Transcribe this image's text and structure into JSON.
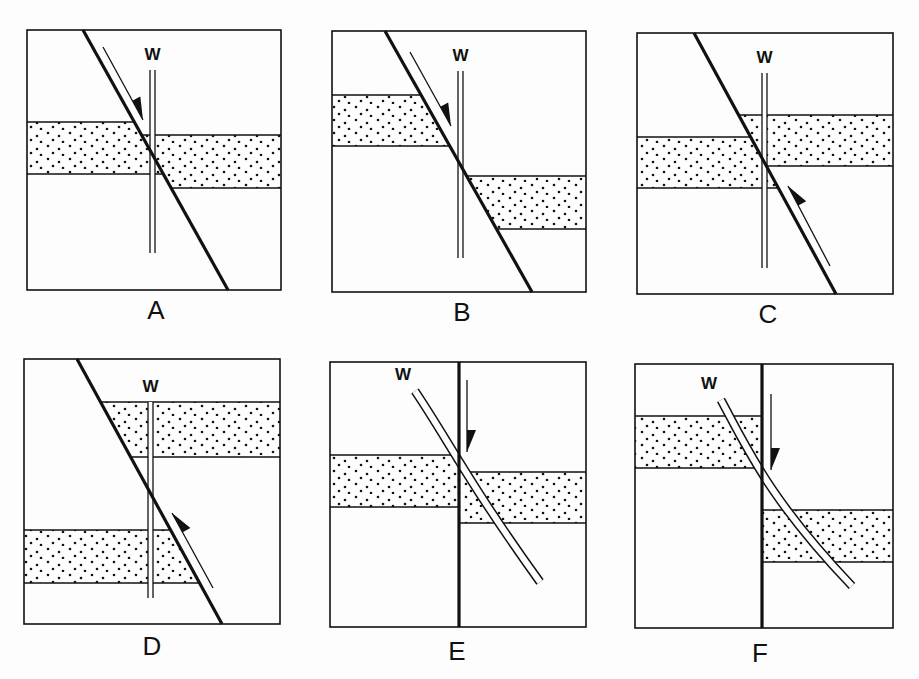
{
  "figure": {
    "colors": {
      "ink": "#111111",
      "paper": "#fdfdfd"
    },
    "well_label": "W",
    "panels": [
      {
        "id": "A",
        "label": "A",
        "box": [
          27,
          30,
          281,
          290
        ],
        "fault": {
          "type": "inclined",
          "from": [
            83,
            30
          ],
          "to": [
            228,
            290
          ]
        },
        "arrow": {
          "from": [
            103,
            47
          ],
          "to": [
            143,
            120
          ],
          "direction": "down"
        },
        "well": {
          "type": "straight",
          "x": 150,
          "gap": 5,
          "top": 70,
          "bottom": 253
        },
        "beds": [
          {
            "side": "left",
            "top": 122,
            "bottom": 174
          },
          {
            "side": "right",
            "top": 135,
            "bottom": 188
          }
        ],
        "label_pos": [
          156,
          297
        ]
      },
      {
        "id": "B",
        "label": "B",
        "box": [
          332,
          31,
          586,
          292
        ],
        "fault": {
          "type": "inclined",
          "from": [
            385,
            31
          ],
          "to": [
            532,
            292
          ]
        },
        "arrow": {
          "from": [
            410,
            52
          ],
          "to": [
            451,
            126
          ],
          "direction": "down"
        },
        "well": {
          "type": "straight",
          "x": 458,
          "gap": 5,
          "top": 71,
          "bottom": 258
        },
        "beds": [
          {
            "side": "left",
            "top": 95,
            "bottom": 146
          },
          {
            "side": "right",
            "top": 176,
            "bottom": 229
          }
        ],
        "label_pos": [
          462,
          299
        ]
      },
      {
        "id": "C",
        "label": "C",
        "box": [
          637,
          33,
          893,
          294
        ],
        "fault": {
          "type": "inclined",
          "from": [
            694,
            33
          ],
          "to": [
            836,
            294
          ]
        },
        "arrow": {
          "from": [
            830,
            266
          ],
          "to": [
            788,
            186
          ],
          "direction": "up"
        },
        "well": {
          "type": "straight",
          "x": 762,
          "gap": 5,
          "top": 73,
          "bottom": 268
        },
        "beds": [
          {
            "side": "left",
            "top": 137,
            "bottom": 188
          },
          {
            "side": "right",
            "top": 115,
            "bottom": 166
          }
        ],
        "label_pos": [
          768,
          301
        ]
      },
      {
        "id": "D",
        "label": "D",
        "box": [
          24,
          359,
          280,
          624
        ],
        "fault": {
          "type": "inclined",
          "from": [
            77,
            359
          ],
          "to": [
            222,
            624
          ]
        },
        "arrow": {
          "from": [
            213,
            588
          ],
          "to": [
            172,
            513
          ],
          "direction": "up"
        },
        "well": {
          "type": "straight",
          "x": 148,
          "gap": 5,
          "top": 402,
          "bottom": 598
        },
        "beds": [
          {
            "side": "right",
            "top": 402,
            "bottom": 457
          },
          {
            "side": "left",
            "top": 530,
            "bottom": 583
          }
        ],
        "label_pos": [
          152,
          633
        ]
      },
      {
        "id": "E",
        "label": "E",
        "box": [
          330,
          362,
          586,
          627
        ],
        "fault": {
          "type": "vertical",
          "x": 459
        },
        "arrow": {
          "from": [
            467,
            380
          ],
          "to": [
            467,
            452
          ],
          "direction": "down"
        },
        "well": {
          "type": "curved",
          "gap": 6,
          "points": [
            [
              415,
              391
            ],
            [
              448,
              440
            ],
            [
              470,
              485
            ],
            [
              540,
              582
            ]
          ]
        },
        "beds": [
          {
            "side": "left",
            "top": 455,
            "bottom": 507
          },
          {
            "side": "right",
            "top": 472,
            "bottom": 523
          }
        ],
        "label_pos": [
          457,
          638
        ]
      },
      {
        "id": "F",
        "label": "F",
        "box": [
          635,
          364,
          893,
          628
        ],
        "fault": {
          "type": "vertical",
          "x": 762
        },
        "arrow": {
          "from": [
            771,
            394
          ],
          "to": [
            771,
            470
          ],
          "direction": "down"
        },
        "well": {
          "type": "curved",
          "gap": 6,
          "points": [
            [
              721,
              400
            ],
            [
              748,
              450
            ],
            [
              770,
              500
            ],
            [
              852,
              586
            ]
          ]
        },
        "beds": [
          {
            "side": "left",
            "top": 416,
            "bottom": 468
          },
          {
            "side": "right",
            "top": 510,
            "bottom": 562
          }
        ],
        "label_pos": [
          760,
          640
        ]
      }
    ]
  }
}
